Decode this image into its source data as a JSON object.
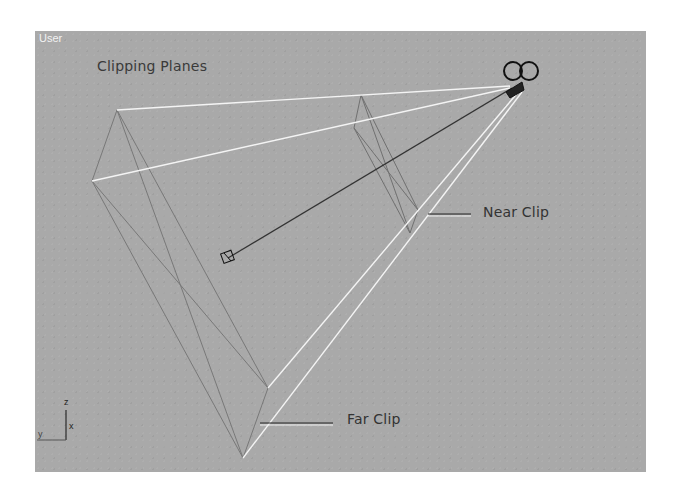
{
  "viewport": {
    "label": "User",
    "background_color": "#a9a9a9"
  },
  "figure": {
    "title": "Clipping Planes",
    "callouts": {
      "near_clip": "Near Clip",
      "far_clip": "Far Clip"
    }
  },
  "axis_tripod": {
    "z": "z",
    "x": "x",
    "y": "y"
  },
  "colors": {
    "frustum_edges": "#ffffff",
    "clip_plane_edges": "#777777",
    "target_line": "#333333",
    "camera_icon": "#111111"
  }
}
